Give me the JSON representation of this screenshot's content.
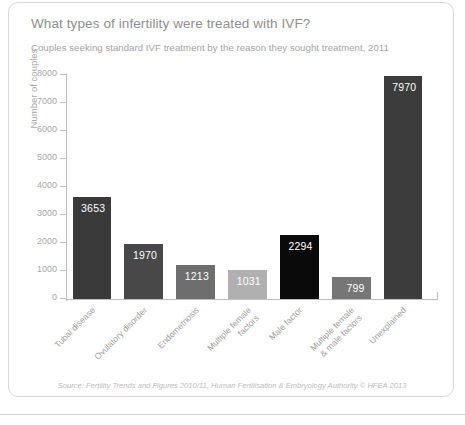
{
  "card": {
    "title": "What types of infertility were treated with IVF?",
    "subtitle": "Couples seeking standard IVF treatment by the reason they sought treatment, 2011",
    "source": "Source: Fertility Trends and Figures 2010/11, Human Fertilisation & Embryology Authority © HFEA 2013"
  },
  "chart_data": {
    "type": "bar",
    "title": "What types of infertility were treated with IVF?",
    "subtitle": "Couples seeking standard IVF treatment by the reason they sought treatment, 2011",
    "xlabel": "",
    "ylabel": "Number of couples",
    "ylim": [
      0,
      8000
    ],
    "yticks": [
      0,
      1000,
      2000,
      3000,
      4000,
      5000,
      6000,
      7000,
      8000
    ],
    "ytick_labels": [
      "0",
      "1000",
      "2000",
      "3000",
      "4000",
      "5000",
      "6000",
      "7000",
      "8000"
    ],
    "grid": false,
    "legend": "none",
    "categories": [
      "Tubal disease",
      "Ovulatory disorder",
      "Endometriosis",
      "Multiple female\nfactors",
      "Male factor",
      "Multiple female\n& male factors",
      "Unexplained"
    ],
    "values": [
      3653,
      1970,
      1213,
      1031,
      2294,
      799,
      7970
    ],
    "data_labels": [
      "3653",
      "1970",
      "1213",
      "1031",
      "2294",
      "799",
      "7970"
    ],
    "colors": [
      "#3a3a3a",
      "#484848",
      "#6e6e6e",
      "#b0b0b0",
      "#0a0a0a",
      "#767676",
      "#3c3c3c"
    ]
  },
  "palette": {
    "axis": "#bdbdbd",
    "title_text": "#8e8e8e",
    "subtitle_text": "#a3a3a3",
    "tick_text": "#a8a8a8",
    "source_text": "#bcbcbc",
    "card_border": "#d8d8d8",
    "background": "#ffffff",
    "value_label": "#ffffff"
  }
}
